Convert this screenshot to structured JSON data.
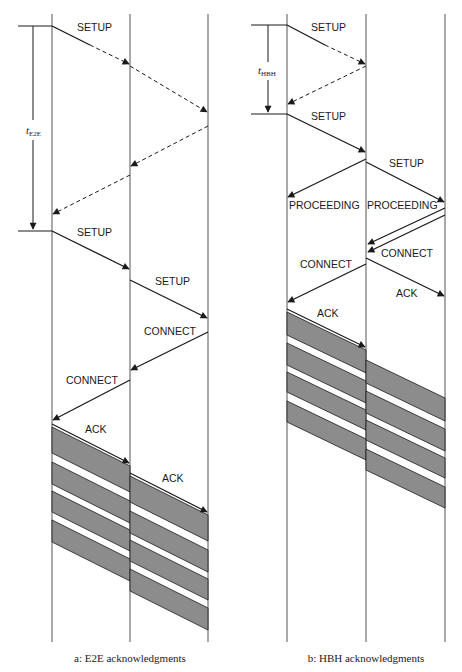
{
  "diagram": {
    "panels": [
      {
        "id": "e2e",
        "caption": "a:  E2E acknowledgments",
        "timer": {
          "symbol": "t",
          "subscript": "E2E"
        },
        "messages": [
          {
            "label": "SETUP",
            "style": "solid-then-dashed"
          },
          {
            "label": "",
            "style": "dashed"
          },
          {
            "label": "",
            "style": "dashed"
          },
          {
            "label": "",
            "style": "dashed"
          },
          {
            "label": "SETUP",
            "style": "solid"
          },
          {
            "label": "SETUP",
            "style": "solid"
          },
          {
            "label": "CONNECT",
            "style": "solid"
          },
          {
            "label": "CONNECT",
            "style": "solid"
          },
          {
            "label": "ACK",
            "style": "solid"
          },
          {
            "label": "ACK",
            "style": "solid"
          }
        ]
      },
      {
        "id": "hbh",
        "caption": "b:  HBH acknowledgments",
        "timer": {
          "symbol": "t",
          "subscript": "HBH"
        },
        "messages": [
          {
            "label": "SETUP",
            "style": "solid-then-dashed"
          },
          {
            "label": "",
            "style": "dashed"
          },
          {
            "label": "SETUP",
            "style": "solid"
          },
          {
            "label": "PROCEEDING",
            "style": "solid"
          },
          {
            "label": "SETUP",
            "style": "solid"
          },
          {
            "label": "PROCEEDING",
            "style": "solid"
          },
          {
            "label": "CONNECT",
            "style": "solid"
          },
          {
            "label": "CONNECT",
            "style": "solid"
          },
          {
            "label": "ACK",
            "style": "solid"
          },
          {
            "label": "ACK",
            "style": "solid"
          }
        ]
      }
    ],
    "colors": {
      "line": "#1a1a1a",
      "band": "#8c8c8c",
      "background": "#ffffff"
    }
  }
}
